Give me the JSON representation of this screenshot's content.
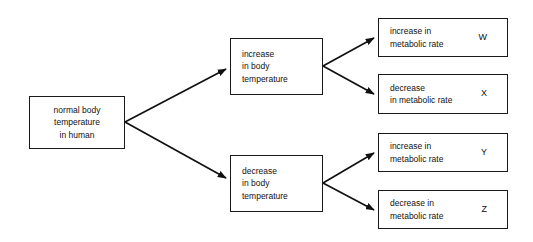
{
  "diagram": {
    "type": "flowchart",
    "root": {
      "label": "normal body\ntemperature\nin human"
    },
    "branches": [
      {
        "label": "increase\nin body\ntemperature",
        "outcomes": [
          {
            "text": "increase in\nmetabolic rate",
            "key": "W"
          },
          {
            "text": "decrease\nin metabolic rate",
            "key": "X"
          }
        ]
      },
      {
        "label": "decrease\nin body\ntemperature",
        "outcomes": [
          {
            "text": "increase in\nmetabolic rate",
            "key": "Y"
          },
          {
            "text": "decrease in\nmetabolic rate",
            "key": "Z"
          }
        ]
      }
    ],
    "colors": {
      "background": "#ffffff",
      "stroke": "#1a1a1a",
      "text": "#111111"
    }
  }
}
